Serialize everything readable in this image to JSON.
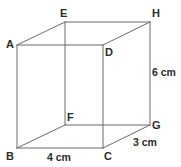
{
  "figure": {
    "type": "geometry-diagram",
    "shape": "cuboid",
    "background_color": "#ffffff",
    "line_color": "#6b6b6b",
    "label_color": "#2b2b2b",
    "vertices": [
      {
        "id": "A",
        "label": "A",
        "x": 17,
        "y": 45,
        "label_x": 6,
        "label_y": 39
      },
      {
        "id": "E",
        "label": "E",
        "x": 65,
        "y": 22,
        "label_x": 60,
        "label_y": 8
      },
      {
        "id": "H",
        "label": "H",
        "x": 150,
        "y": 22,
        "label_x": 152,
        "label_y": 8
      },
      {
        "id": "D",
        "label": "D",
        "x": 103,
        "y": 45,
        "label_x": 105,
        "label_y": 47
      },
      {
        "id": "F",
        "label": "F",
        "x": 65,
        "y": 125,
        "label_x": 67,
        "label_y": 112
      },
      {
        "id": "G",
        "label": "G",
        "x": 150,
        "y": 125,
        "label_x": 152,
        "label_y": 120
      },
      {
        "id": "B",
        "label": "B",
        "x": 17,
        "y": 148,
        "label_x": 6,
        "label_y": 151
      },
      {
        "id": "C",
        "label": "C",
        "x": 103,
        "y": 148,
        "label_x": 104,
        "label_y": 151
      }
    ],
    "edges": [
      {
        "name": "edge-A-D",
        "from": "A",
        "to": "D"
      },
      {
        "name": "edge-A-B",
        "from": "A",
        "to": "B"
      },
      {
        "name": "edge-B-C",
        "from": "B",
        "to": "C"
      },
      {
        "name": "edge-C-D",
        "from": "C",
        "to": "D"
      },
      {
        "name": "edge-E-H",
        "from": "E",
        "to": "H"
      },
      {
        "name": "edge-E-F",
        "from": "E",
        "to": "F"
      },
      {
        "name": "edge-F-G",
        "from": "F",
        "to": "G"
      },
      {
        "name": "edge-G-H",
        "from": "G",
        "to": "H"
      },
      {
        "name": "edge-A-E",
        "from": "A",
        "to": "E"
      },
      {
        "name": "edge-D-H",
        "from": "D",
        "to": "H"
      },
      {
        "name": "edge-B-F",
        "from": "B",
        "to": "F"
      },
      {
        "name": "edge-C-G",
        "from": "C",
        "to": "G"
      }
    ],
    "dimensions": [
      {
        "id": "height",
        "text": "6 cm",
        "edge": "G-H",
        "x": 152,
        "y": 67
      },
      {
        "id": "depth",
        "text": "3 cm",
        "edge": "C-G",
        "x": 133,
        "y": 137
      },
      {
        "id": "width",
        "text": "4 cm",
        "edge": "B-C",
        "x": 47,
        "y": 152
      }
    ]
  }
}
